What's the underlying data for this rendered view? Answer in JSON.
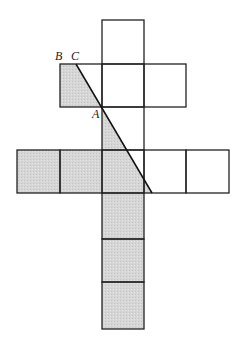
{
  "diagram": {
    "type": "cube-net-with-diagonal-cut",
    "labels": [
      {
        "id": "B",
        "text": "B",
        "x": 55,
        "y": 60
      },
      {
        "id": "C",
        "text": "C",
        "x": 71,
        "y": 60
      },
      {
        "id": "A",
        "text": "A",
        "x": 92,
        "y": 118
      }
    ],
    "colors": {
      "stroke": "#222222",
      "shade": "#d4d4d4",
      "background": "#ffffff"
    },
    "grid": {
      "cols_x": [
        17,
        60,
        102,
        144,
        186,
        229
      ],
      "rows_y": [
        20,
        64,
        107,
        150,
        193,
        239,
        282,
        329
      ]
    },
    "cells": [
      {
        "col": 2,
        "row": 0,
        "shaded": false
      },
      {
        "col": 1,
        "row": 1,
        "shaded": "partial"
      },
      {
        "col": 2,
        "row": 1,
        "shaded": false
      },
      {
        "col": 3,
        "row": 1,
        "shaded": false
      },
      {
        "col": 2,
        "row": 2,
        "shaded": "partial"
      },
      {
        "col": 0,
        "row": 3,
        "shaded": true
      },
      {
        "col": 1,
        "row": 3,
        "shaded": true
      },
      {
        "col": 2,
        "row": 3,
        "shaded": "partial"
      },
      {
        "col": 3,
        "row": 3,
        "shaded": "partial"
      },
      {
        "col": 4,
        "row": 3,
        "shaded": false
      },
      {
        "col": 2,
        "row": 4,
        "shaded": true
      },
      {
        "col": 2,
        "row": 5,
        "shaded": true
      },
      {
        "col": 2,
        "row": 6,
        "shaded": true
      }
    ],
    "diagonal": {
      "from": [
        76,
        64
      ],
      "to": [
        152,
        193
      ],
      "passes_through": "A"
    }
  }
}
